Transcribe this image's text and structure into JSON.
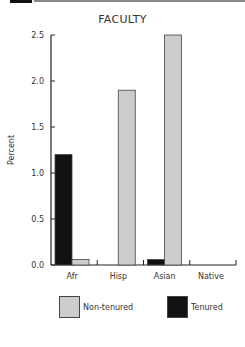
{
  "chart_data": {
    "type": "bar",
    "title": "FACULTY",
    "xlabel": "",
    "ylabel": "Percent",
    "ylim": [
      0,
      2.5
    ],
    "yticks": [
      "0.0",
      "0.5",
      "1.0",
      "1.5",
      "2.0",
      "2.5"
    ],
    "grid": false,
    "legend_position": "bottom",
    "categories": [
      "Afr",
      "Hisp",
      "Asian",
      "Native"
    ],
    "series": [
      {
        "name": "Tenured",
        "color": "#111111",
        "values": [
          1.2,
          0.0,
          0.06,
          0.0
        ]
      },
      {
        "name": "Non-tenured",
        "color": "#cccccc",
        "values": [
          0.06,
          1.9,
          2.5,
          0.0
        ]
      }
    ]
  },
  "legend": {
    "items": [
      {
        "label": "Non-tenured",
        "color": "#cccccc"
      },
      {
        "label": "Tenured",
        "color": "#111111"
      }
    ]
  }
}
